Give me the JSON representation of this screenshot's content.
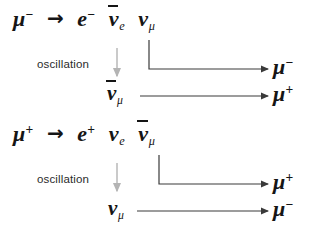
{
  "figure": {
    "background_color": "#ffffff",
    "ink_color": "#151515",
    "oscillation_arrow_color": "#b4b4b4",
    "connector_color": "#3a3a3a"
  },
  "symbols": {
    "mu": "μ",
    "nu": "ν",
    "e": "e",
    "decay_arrow": "→",
    "minus": "−",
    "plus": "+",
    "sub_e": "e",
    "sub_mu": "μ"
  },
  "blocks": [
    {
      "id": "muon-minus-decay",
      "equation": {
        "parent": {
          "symbol": "μ",
          "charge": "−",
          "antibar": false
        },
        "arrow": "→",
        "products": [
          {
            "symbol": "e",
            "charge": "−",
            "subscript": "",
            "antibar": false
          },
          {
            "symbol": "ν",
            "charge": "",
            "subscript": "e",
            "antibar": true
          },
          {
            "symbol": "ν",
            "charge": "",
            "subscript": "μ",
            "antibar": false
          }
        ]
      },
      "oscillation_label": "oscillation",
      "rows": [
        {
          "id": "row-numu-to-mu-minus",
          "source": {
            "symbol": "ν",
            "charge": "",
            "subscript": "μ",
            "antibar": false,
            "from_equation": true
          },
          "result": {
            "symbol": "μ",
            "charge": "−",
            "subscript": "",
            "antibar": false
          },
          "connector": "elbow"
        },
        {
          "id": "row-antinumu-to-mu-plus",
          "source": {
            "symbol": "ν",
            "charge": "",
            "subscript": "μ",
            "antibar": true,
            "from_equation": false
          },
          "result": {
            "symbol": "μ",
            "charge": "+",
            "subscript": "",
            "antibar": false
          },
          "connector": "straight"
        }
      ]
    },
    {
      "id": "muon-plus-decay",
      "equation": {
        "parent": {
          "symbol": "μ",
          "charge": "+",
          "antibar": false
        },
        "arrow": "→",
        "products": [
          {
            "symbol": "e",
            "charge": "+",
            "subscript": "",
            "antibar": false
          },
          {
            "symbol": "ν",
            "charge": "",
            "subscript": "e",
            "antibar": false
          },
          {
            "symbol": "ν",
            "charge": "",
            "subscript": "μ",
            "antibar": true
          }
        ]
      },
      "oscillation_label": "oscillation",
      "rows": [
        {
          "id": "row-antinumu-to-mu-plus-2",
          "source": {
            "symbol": "ν",
            "charge": "",
            "subscript": "μ",
            "antibar": true,
            "from_equation": true
          },
          "result": {
            "symbol": "μ",
            "charge": "+",
            "subscript": "",
            "antibar": false
          },
          "connector": "elbow"
        },
        {
          "id": "row-numu-to-mu-minus-2",
          "source": {
            "symbol": "ν",
            "charge": "",
            "subscript": "μ",
            "antibar": false,
            "from_equation": false
          },
          "result": {
            "symbol": "μ",
            "charge": "−",
            "subscript": "",
            "antibar": false
          },
          "connector": "straight"
        }
      ]
    }
  ],
  "text_runs": {
    "eq1_mu": "μ",
    "eq1_mu_charge": "−",
    "eq1_arrow": "→",
    "eq1_e": "e",
    "eq1_e_charge": "−",
    "eq1_nu1": "ν",
    "eq1_nu1_sub": "e",
    "eq1_nu2": "ν",
    "eq1_nu2_sub": "μ",
    "osc1": "oscillation",
    "r1_result": "μ",
    "r1_result_charge": "−",
    "r2_src": "ν",
    "r2_src_sub": "μ",
    "r2_result": "μ",
    "r2_result_charge": "+",
    "eq2_mu": "μ",
    "eq2_mu_charge": "+",
    "eq2_arrow": "→",
    "eq2_e": "e",
    "eq2_e_charge": "+",
    "eq2_nu1": "ν",
    "eq2_nu1_sub": "e",
    "eq2_nu2": "ν",
    "eq2_nu2_sub": "μ",
    "osc2": "oscillation",
    "r3_result": "μ",
    "r3_result_charge": "+",
    "r4_src": "ν",
    "r4_src_sub": "μ",
    "r4_result": "μ",
    "r4_result_charge": "−"
  }
}
